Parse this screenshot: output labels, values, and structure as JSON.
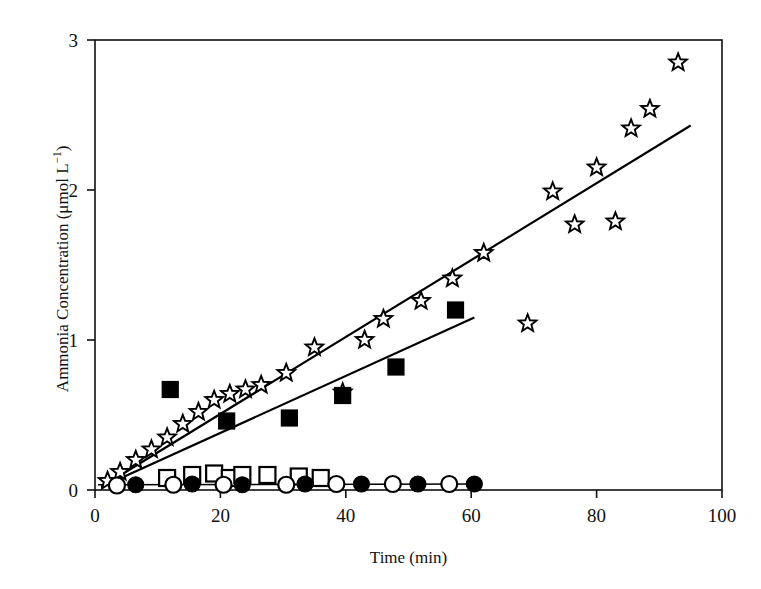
{
  "chart_data": {
    "type": "scatter",
    "title": "",
    "xlabel": "Time (min)",
    "ylabel_text": "Ammonia Concentration (μmol L",
    "ylabel_sup": "−1",
    "ylabel_tail": ")",
    "ylabel_full": "Ammonia Concentration (μmol L−1)",
    "xlim": [
      0,
      100
    ],
    "ylim": [
      0,
      3
    ],
    "xticks": [
      0,
      20,
      40,
      60,
      80,
      100
    ],
    "xticklabels": [
      "0",
      "20",
      "40",
      "60",
      "80",
      "100"
    ],
    "yticks": [
      0,
      1,
      2,
      3
    ],
    "yticklabels": [
      "0",
      "1",
      "2",
      "3"
    ],
    "grid": false,
    "legend": "none",
    "frame": "box",
    "series": [
      {
        "name": "open-star-series",
        "marker": "open-star",
        "color": "#000000",
        "fill": "#ffffff",
        "points": [
          [
            2.0,
            0.06
          ],
          [
            4.0,
            0.12
          ],
          [
            6.5,
            0.2
          ],
          [
            9.0,
            0.27
          ],
          [
            11.5,
            0.35
          ],
          [
            14.0,
            0.44
          ],
          [
            16.5,
            0.52
          ],
          [
            19.0,
            0.6
          ],
          [
            21.5,
            0.64
          ],
          [
            24.0,
            0.67
          ],
          [
            26.5,
            0.7
          ],
          [
            30.5,
            0.78
          ],
          [
            35.0,
            0.95
          ],
          [
            39.5,
            0.65
          ],
          [
            43.0,
            1.0
          ],
          [
            46.0,
            1.14
          ],
          [
            52.0,
            1.26
          ],
          [
            57.0,
            1.41
          ],
          [
            62.0,
            1.58
          ],
          [
            69.0,
            1.11
          ],
          [
            73.0,
            1.99
          ],
          [
            76.5,
            1.77
          ],
          [
            80.0,
            2.15
          ],
          [
            83.0,
            1.79
          ],
          [
            85.5,
            2.41
          ],
          [
            88.5,
            2.54
          ],
          [
            93.0,
            2.85
          ]
        ]
      },
      {
        "name": "filled-square-series",
        "marker": "filled-square",
        "color": "#000000",
        "fill": "#000000",
        "points": [
          [
            12.0,
            0.67
          ],
          [
            21.0,
            0.46
          ],
          [
            31.0,
            0.48
          ],
          [
            39.5,
            0.63
          ],
          [
            48.0,
            0.82
          ],
          [
            57.5,
            1.2
          ]
        ]
      },
      {
        "name": "open-square-series",
        "marker": "open-square",
        "color": "#000000",
        "fill": "#ffffff",
        "points": [
          [
            11.5,
            0.08
          ],
          [
            15.5,
            0.1
          ],
          [
            19.0,
            0.11
          ],
          [
            21.5,
            0.08
          ],
          [
            23.5,
            0.1
          ],
          [
            27.5,
            0.1
          ],
          [
            32.5,
            0.09
          ],
          [
            36.0,
            0.08
          ]
        ]
      },
      {
        "name": "filled-circle-series",
        "marker": "filled-circle",
        "color": "#000000",
        "fill": "#000000",
        "points": [
          [
            6.5,
            0.035
          ],
          [
            15.5,
            0.04
          ],
          [
            23.5,
            0.035
          ],
          [
            33.5,
            0.04
          ],
          [
            42.5,
            0.04
          ],
          [
            51.5,
            0.04
          ],
          [
            60.5,
            0.04
          ]
        ]
      },
      {
        "name": "open-circle-series",
        "marker": "open-circle",
        "color": "#000000",
        "fill": "#ffffff",
        "points": [
          [
            3.5,
            0.03
          ],
          [
            12.5,
            0.035
          ],
          [
            20.5,
            0.035
          ],
          [
            30.5,
            0.035
          ],
          [
            38.5,
            0.04
          ],
          [
            47.5,
            0.04
          ],
          [
            56.5,
            0.04
          ]
        ]
      }
    ],
    "trendlines": [
      {
        "name": "star-trendline",
        "for_series": "open-star-series",
        "x": [
          1.0,
          95.0
        ],
        "y": [
          0.02,
          2.43
        ],
        "color": "#000000",
        "width": 2.2
      },
      {
        "name": "square-trendline",
        "for_series": "filled-square-series",
        "x": [
          1.0,
          60.5
        ],
        "y": [
          0.02,
          1.15
        ],
        "color": "#000000",
        "width": 2.2
      },
      {
        "name": "baseline-trendline",
        "for_series": "circle-series",
        "x": [
          0.5,
          61.5
        ],
        "y": [
          0.035,
          0.04
        ],
        "color": "#000000",
        "width": 1.6
      }
    ]
  }
}
